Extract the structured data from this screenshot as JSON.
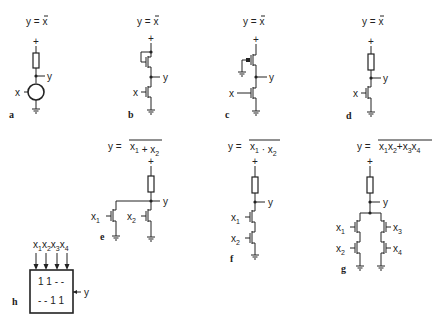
{
  "circuits": [
    {
      "id": "a",
      "label": "a",
      "equation": "y = x̄",
      "eq_lhs": "y =",
      "eq_rhs": "x",
      "input": "x",
      "output": "y",
      "type": "resistor load, generic switch"
    },
    {
      "id": "b",
      "label": "b",
      "equation": "y = x̄",
      "eq_lhs": "y =",
      "eq_rhs": "x",
      "input": "x",
      "output": "y",
      "type": "enhancement load NMOS inverter"
    },
    {
      "id": "c",
      "label": "c",
      "equation": "y = x̄",
      "eq_lhs": "y =",
      "eq_rhs": "x",
      "input": "x",
      "output": "y",
      "type": "depletion/PMOS load inverter"
    },
    {
      "id": "d",
      "label": "d",
      "equation": "y = x̄",
      "eq_lhs": "y =",
      "eq_rhs": "x",
      "input": "x",
      "output": "y",
      "type": "resistor load NMOS inverter"
    },
    {
      "id": "e",
      "label": "e",
      "equation": "y = NOT(x1 + x2)",
      "eq_lhs": "y =",
      "inputs": [
        "x1",
        "x2"
      ],
      "output": "y",
      "type": "NOR"
    },
    {
      "id": "f",
      "label": "f",
      "equation": "y = NOT(x1 · x2)",
      "eq_lhs": "y =",
      "inputs": [
        "x1",
        "x2"
      ],
      "output": "y",
      "type": "NAND"
    },
    {
      "id": "g",
      "label": "g",
      "equation": "y = NOT(x1x2 + x3x4)",
      "eq_lhs": "y =",
      "inputs": [
        "x1",
        "x2",
        "x3",
        "x4"
      ],
      "output": "y",
      "type": "AND-OR-INVERT"
    },
    {
      "id": "h",
      "label": "h",
      "inputs": [
        "x1",
        "x2",
        "x3",
        "x4"
      ],
      "output": "y",
      "rows": [
        "1 1 - -",
        "- - 1 1"
      ],
      "type": "block symbol"
    }
  ],
  "symbols": {
    "supply": "+",
    "x": "x",
    "y": "y",
    "sub1": "1",
    "sub2": "2",
    "sub3": "3",
    "sub4": "4",
    "plus": "+",
    "dot": "·",
    "row1": "1 1 - -",
    "row2": "- - 1 1"
  }
}
